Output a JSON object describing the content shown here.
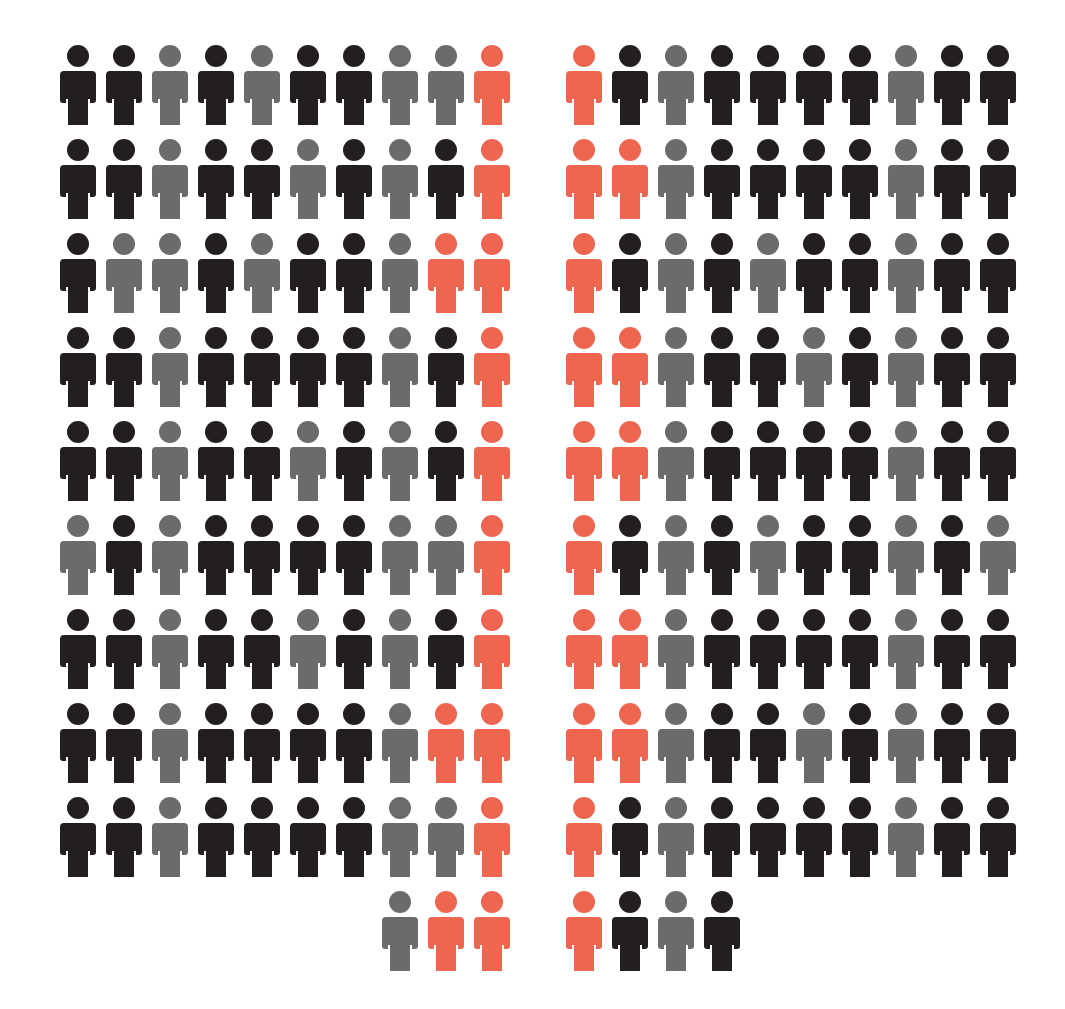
{
  "chart_data": {
    "type": "pictogram",
    "title": "",
    "legend": [],
    "colors": {
      "black": "#231f20",
      "gray": "#6b6b6b",
      "red": "#ee6650"
    },
    "unit": "person icon",
    "layout": "two blocks of 10-wide rows; final partial row of left block right-aligned, right block left-aligned",
    "left_block": {
      "rows": [
        [
          "black",
          "black",
          "gray",
          "black",
          "gray",
          "black",
          "black",
          "gray",
          "gray",
          "red"
        ],
        [
          "black",
          "black",
          "gray",
          "black",
          "black",
          "gray",
          "black",
          "gray",
          "black",
          "red"
        ],
        [
          "black",
          "gray",
          "gray",
          "black",
          "gray",
          "black",
          "black",
          "gray",
          "red",
          "red"
        ],
        [
          "black",
          "black",
          "gray",
          "black",
          "black",
          "black",
          "black",
          "gray",
          "black",
          "red"
        ],
        [
          "black",
          "black",
          "gray",
          "black",
          "black",
          "gray",
          "black",
          "gray",
          "black",
          "red"
        ],
        [
          "gray",
          "black",
          "gray",
          "black",
          "black",
          "black",
          "black",
          "gray",
          "gray",
          "red"
        ],
        [
          "black",
          "black",
          "gray",
          "black",
          "black",
          "gray",
          "black",
          "gray",
          "black",
          "red"
        ],
        [
          "black",
          "black",
          "gray",
          "black",
          "black",
          "black",
          "black",
          "gray",
          "red",
          "red"
        ],
        [
          "black",
          "black",
          "gray",
          "black",
          "black",
          "black",
          "black",
          "gray",
          "gray",
          "red"
        ],
        [
          "gray",
          "red",
          "red"
        ]
      ],
      "counts": {
        "black": 47,
        "gray": 25,
        "red": 14,
        "total": 93
      }
    },
    "right_block": {
      "rows": [
        [
          "red",
          "black",
          "gray",
          "black",
          "black",
          "black",
          "black",
          "gray",
          "black",
          "black"
        ],
        [
          "red",
          "red",
          "gray",
          "black",
          "black",
          "black",
          "black",
          "gray",
          "black",
          "black"
        ],
        [
          "red",
          "black",
          "gray",
          "black",
          "gray",
          "black",
          "black",
          "gray",
          "black",
          "black"
        ],
        [
          "red",
          "red",
          "gray",
          "black",
          "black",
          "gray",
          "black",
          "gray",
          "black",
          "black"
        ],
        [
          "red",
          "red",
          "gray",
          "black",
          "black",
          "black",
          "black",
          "gray",
          "black",
          "black"
        ],
        [
          "red",
          "black",
          "gray",
          "black",
          "gray",
          "black",
          "black",
          "gray",
          "black",
          "gray"
        ],
        [
          "red",
          "red",
          "gray",
          "black",
          "black",
          "black",
          "black",
          "gray",
          "black",
          "black"
        ],
        [
          "red",
          "red",
          "gray",
          "black",
          "black",
          "gray",
          "black",
          "gray",
          "black",
          "black"
        ],
        [
          "red",
          "black",
          "gray",
          "black",
          "black",
          "black",
          "black",
          "gray",
          "black",
          "black"
        ],
        [
          "red",
          "black",
          "gray",
          "black"
        ]
      ],
      "counts": {
        "black": 51,
        "gray": 24,
        "red": 16,
        "total": 94
      }
    }
  }
}
